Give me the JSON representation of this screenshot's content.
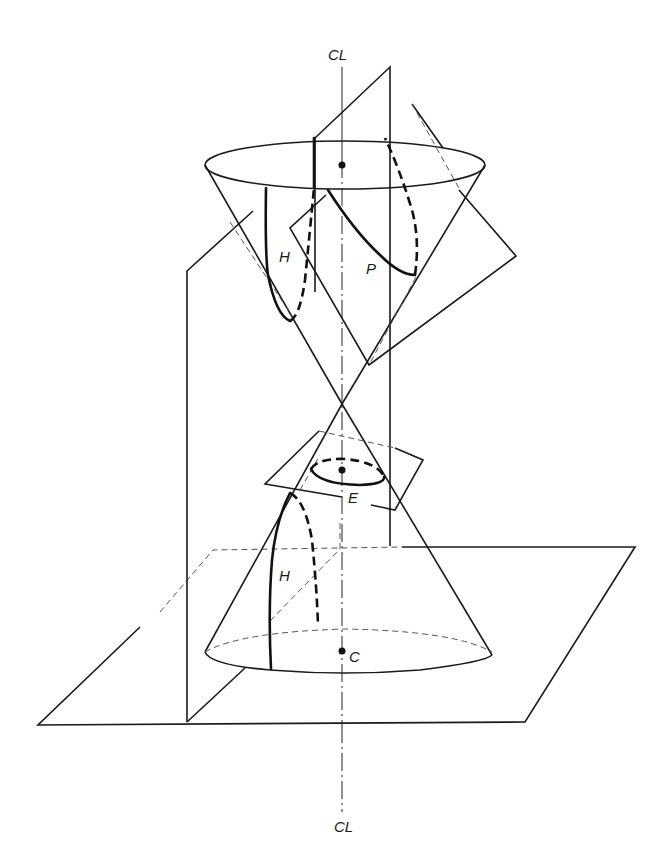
{
  "figure": {
    "labels": {
      "centerline_top": "CL",
      "centerline_bottom": "CL",
      "hyperbola_upper": "H",
      "hyperbola_lower": "H",
      "parabola": "P",
      "ellipse": "E",
      "circle": "C"
    },
    "colors": {
      "line": "#1a1a1a",
      "hidden_line": "#555555",
      "background": "#ffffff"
    }
  }
}
